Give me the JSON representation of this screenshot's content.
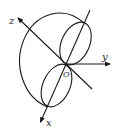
{
  "diagram": {
    "labels": {
      "x": "x",
      "y": "y",
      "z": "z",
      "origin": "O"
    },
    "colors": {
      "stroke": "#1a1a1a",
      "background": "#ffffff"
    }
  }
}
